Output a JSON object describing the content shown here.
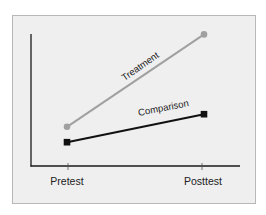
{
  "chart_data": {
    "type": "line",
    "title": "",
    "xlabel": "",
    "ylabel": "",
    "categories": [
      "Pretest",
      "Posttest"
    ],
    "series": [
      {
        "name": "Treatment",
        "values": [
          28,
          94
        ],
        "color": "#a0a0a0",
        "marker": "circle"
      },
      {
        "name": "Comparison",
        "values": [
          17,
          37
        ],
        "color": "#111111",
        "marker": "square"
      }
    ],
    "ylim": [
      0,
      100
    ],
    "grid": false,
    "legend": "inline labels along lines",
    "y_ticks_shown": false
  },
  "labels": {
    "treatment": "Treatment",
    "comparison": "Comparison",
    "pretest": "Pretest",
    "posttest": "Posttest"
  },
  "colors": {
    "panel_bg": "#efefef",
    "panel_border": "#b8b8b8",
    "axis": "#1a1a1a",
    "treatment": "#a0a0a0",
    "comparison": "#111111",
    "text": "#222222"
  }
}
